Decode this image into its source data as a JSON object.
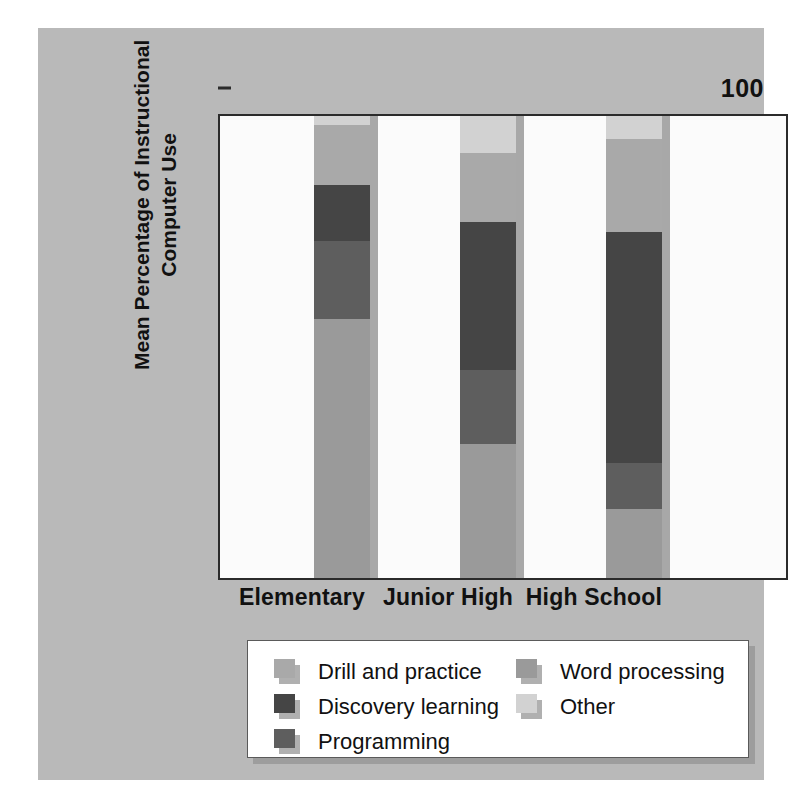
{
  "chart_data": {
    "type": "bar",
    "subtype": "stacked-bar",
    "title": "",
    "xlabel": "",
    "ylabel": "Mean Percentage of Instructional Computer Use",
    "ylim": [
      0,
      100
    ],
    "yticks": [
      0,
      20,
      40,
      60,
      80,
      100
    ],
    "ytick_labels": [
      "0",
      "20",
      "40",
      "60",
      "80",
      "100"
    ],
    "grid": false,
    "legend_position": "bottom",
    "categories": [
      "Elementary",
      "Junior High",
      "High School"
    ],
    "series": [
      {
        "name": "Word processing",
        "color": "#9a9a9a",
        "values": [
          56,
          29,
          15
        ]
      },
      {
        "name": "Programming",
        "color": "#5e5e5e",
        "values": [
          17,
          16,
          10
        ]
      },
      {
        "name": "Discovery learning",
        "color": "#454545",
        "values": [
          12,
          32,
          50
        ]
      },
      {
        "name": "Drill and practice",
        "color": "#a9a9a9",
        "values": [
          13,
          15,
          20
        ]
      },
      {
        "name": "Other",
        "color": "#d2d2d2",
        "values": [
          2,
          8,
          5
        ]
      }
    ],
    "stack_order_bottom_to_top": [
      "Word processing",
      "Programming",
      "Discovery learning",
      "Drill and practice",
      "Other"
    ],
    "annotations": []
  },
  "axis": {
    "y_title_line1": "Mean Percentage of Instructional",
    "y_title_line2": "Computer Use",
    "ticks": [
      {
        "value": 100,
        "label": "100"
      },
      {
        "value": 80,
        "label": "80"
      },
      {
        "value": 60,
        "label": "60"
      },
      {
        "value": 40,
        "label": "40"
      },
      {
        "value": 20,
        "label": "20"
      },
      {
        "value": 0,
        "label": "0"
      }
    ]
  },
  "categories": [
    {
      "label": "Elementary"
    },
    {
      "label": "Junior High"
    },
    {
      "label": "High School"
    }
  ],
  "legend": {
    "left_column": [
      {
        "label": "Drill and practice",
        "color": "#a9a9a9"
      },
      {
        "label": "Discovery learning",
        "color": "#454545"
      },
      {
        "label": "Programming",
        "color": "#5e5e5e"
      }
    ],
    "right_column": [
      {
        "label": "Word processing",
        "color": "#9a9a9a"
      },
      {
        "label": "Other",
        "color": "#d2d2d2"
      }
    ]
  },
  "colors": {
    "page_background": "#b9b9b9",
    "plot_background": "#fbfbfb",
    "axis_line": "#2b2b2b",
    "text": "#111111",
    "bar_shadow": "#a8a8a8"
  }
}
